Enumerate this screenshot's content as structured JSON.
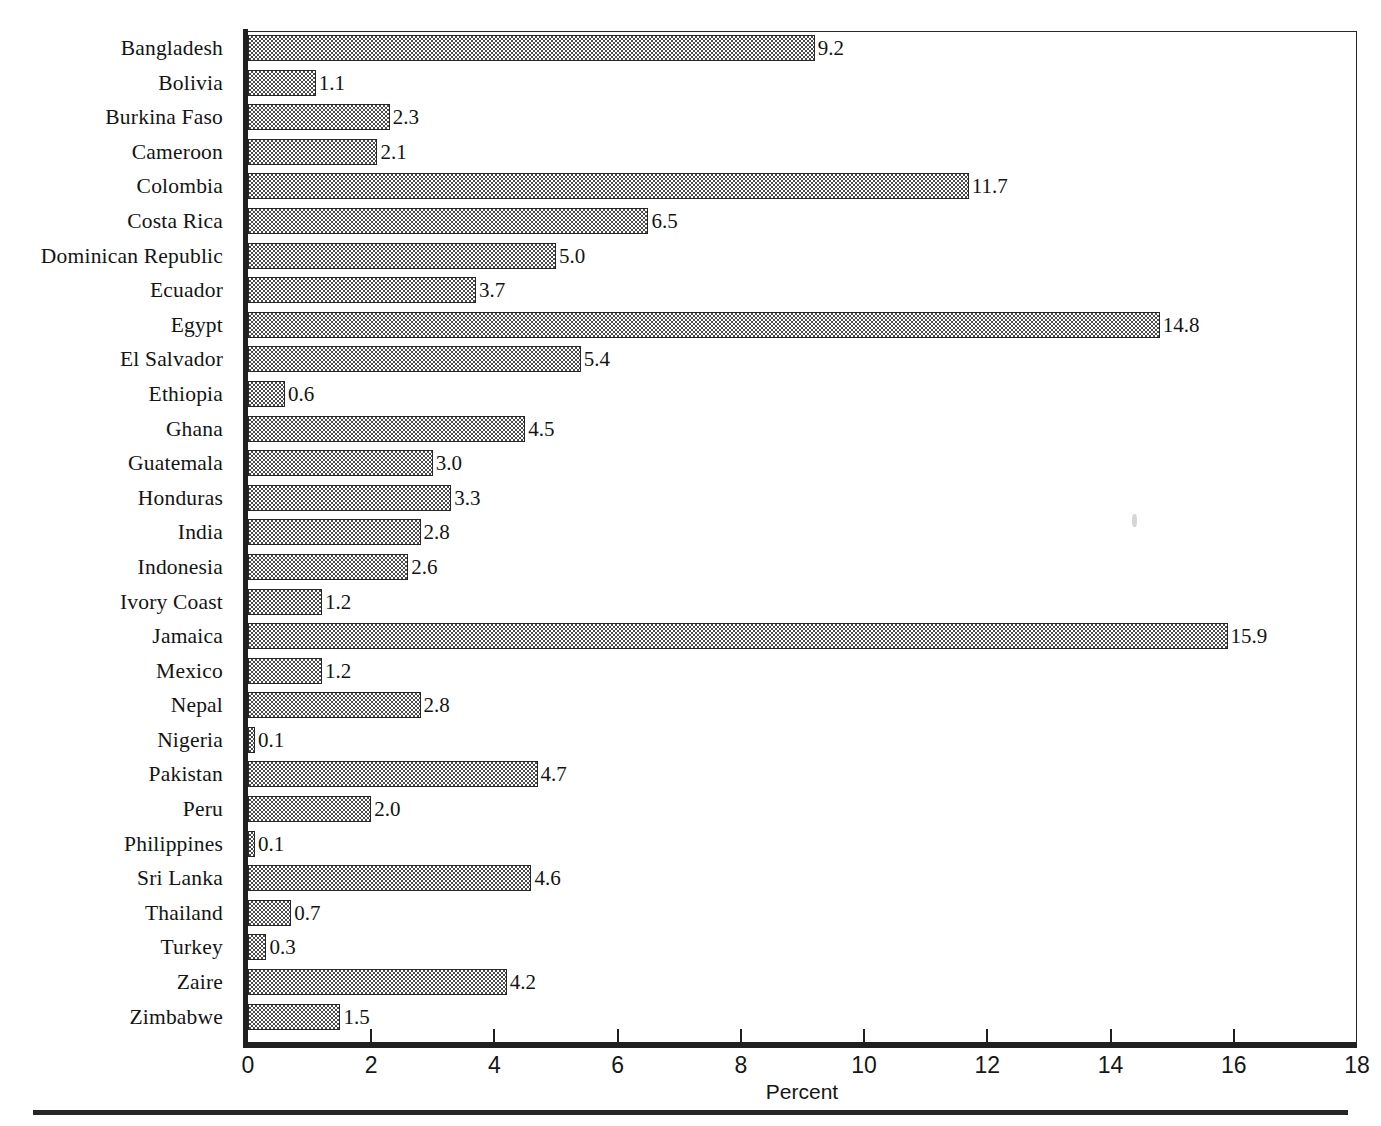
{
  "chart_data": {
    "type": "bar",
    "orientation": "horizontal",
    "title": "",
    "subtitle": "",
    "xlabel": "Percent",
    "ylabel": "",
    "xlim": [
      0,
      18
    ],
    "xticks": [
      0,
      2,
      4,
      6,
      8,
      10,
      12,
      14,
      16,
      18
    ],
    "xtick_labels": [
      "0",
      "2",
      "4",
      "6",
      "8",
      "10",
      "12",
      "14",
      "16",
      "18"
    ],
    "grid": false,
    "legend": null,
    "data_labels": true,
    "bar_fill": "checkered-halftone",
    "bar_edge_color": "#262626",
    "categories": [
      "Bangladesh",
      "Bolivia",
      "Burkina Faso",
      "Cameroon",
      "Colombia",
      "Costa Rica",
      "Dominican Republic",
      "Ecuador",
      "Egypt",
      "El Salvador",
      "Ethiopia",
      "Ghana",
      "Guatemala",
      "Honduras",
      "India",
      "Indonesia",
      "Ivory Coast",
      "Jamaica",
      "Mexico",
      "Nepal",
      "Nigeria",
      "Pakistan",
      "Peru",
      "Philippines",
      "Sri Lanka",
      "Thailand",
      "Turkey",
      "Zaire",
      "Zimbabwe"
    ],
    "values": [
      9.2,
      1.1,
      2.3,
      2.1,
      11.7,
      6.5,
      5.0,
      3.7,
      14.8,
      5.4,
      0.6,
      4.5,
      3.0,
      3.3,
      2.8,
      2.6,
      1.2,
      15.9,
      1.2,
      2.8,
      0.1,
      4.7,
      2.0,
      0.1,
      4.6,
      0.7,
      0.3,
      4.2,
      1.5
    ],
    "value_labels": [
      "9.2",
      "1.1",
      "2.3",
      "2.1",
      "11.7",
      "6.5",
      "5.0",
      "3.7",
      "14.8",
      "5.4",
      "0.6",
      "4.5",
      "3.0",
      "3.3",
      "2.8",
      "2.6",
      "1.2",
      "15.9",
      "1.2",
      "2.8",
      "0.1",
      "4.7",
      "2.0",
      "0.1",
      "4.6",
      "0.7",
      "0.3",
      "4.2",
      "1.5"
    ]
  }
}
